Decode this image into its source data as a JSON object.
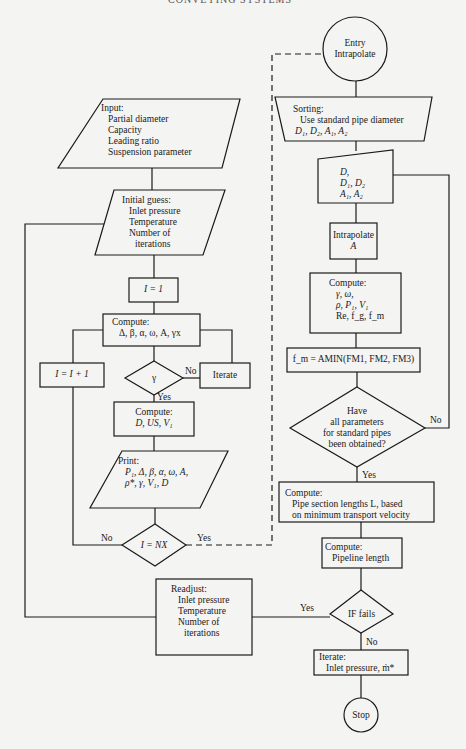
{
  "header": {
    "running_head": "CONVEYING SYSTEMS"
  },
  "left_flow": {
    "input": {
      "title": "Input:",
      "items": [
        "Partial diameter",
        "Capacity",
        "Leading ratio",
        "Suspension parameter"
      ]
    },
    "initial_guess": {
      "title": "Initial guess:",
      "items": [
        "Inlet pressure",
        "Temperature",
        "Number of",
        "iterations"
      ]
    },
    "init_counter": "I = 1",
    "compute1": {
      "title": "Compute:",
      "expr": "Δ, β, α, ω, A, γx"
    },
    "increment": "I = I + 1",
    "gamma_decision": "γ",
    "iterate": "Iterate",
    "compute2": {
      "title": "Compute:",
      "expr": "D, US, V₁"
    },
    "print": {
      "title": "Print:",
      "line1": "P₁, Δ, β, α, ω, A,",
      "line2": "ρ*, γ, V₁, D"
    },
    "nx_decision": "I = NX",
    "readjust": {
      "title": "Readjust:",
      "items": [
        "Inlet pressure",
        "Temperature",
        "Number of",
        "iterations"
      ]
    }
  },
  "right_flow": {
    "entry": {
      "line1": "Entry",
      "line2": "Intrapolate"
    },
    "sorting": {
      "title": "Sorting:",
      "line1": "Use standard pipe diameter",
      "line2": "D₁, D₂, A₁, A₂"
    },
    "manual_input": {
      "line1": "D,",
      "line2": "D₁, D₂",
      "line3": "A₁, A₂"
    },
    "intrapolate": {
      "line1": "Intrapolate",
      "line2": "A"
    },
    "compute3": {
      "title": "Compute:",
      "line1": "γ, ω,",
      "line2": "ρ, P₁, V₁",
      "line3": "Re, f_g, f_m"
    },
    "fm_assign": "f_m = AMIN(FM1, FM2, FM3)",
    "params_decision": {
      "line1": "Have",
      "line2": "all parameters",
      "line3": "for standard pipes",
      "line4": "been obtained?"
    },
    "compute4": {
      "title": "Compute:",
      "line1": "Pipe section lengths L, based",
      "line2": "on minimum transport velocity"
    },
    "compute5": {
      "title": "Compute:",
      "line1": "Pipeline length"
    },
    "if_fails": "IF fails",
    "iterate2": {
      "title": "Iterate:",
      "line1": "Inlet pressure, ṁ*"
    },
    "stop": "Stop"
  },
  "edge_labels": {
    "no": "No",
    "yes": "Yes"
  }
}
